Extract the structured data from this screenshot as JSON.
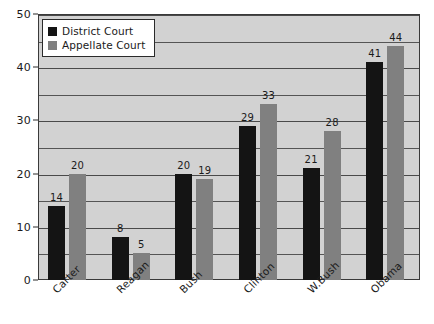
{
  "chart_data": {
    "type": "bar",
    "title": "",
    "xlabel": "",
    "ylabel": "",
    "ylim": [
      0,
      50
    ],
    "y_ticks": [
      0,
      10,
      20,
      30,
      40,
      50
    ],
    "y_tick_labels": [
      "0",
      "10",
      "20",
      "30",
      "40",
      "50"
    ],
    "y_gridlines": [
      5,
      10,
      15,
      20,
      25,
      30,
      35,
      40,
      45,
      50
    ],
    "grid": true,
    "legend_position": "upper left",
    "categories": [
      "Carter",
      "Reagan",
      "Bush",
      "Clinton",
      "W.Bush",
      "Obama"
    ],
    "series": [
      {
        "name": "District Court",
        "color": "#141414",
        "values": [
          14,
          8,
          20,
          29,
          21,
          41
        ],
        "labels": [
          "14",
          "8",
          "20",
          "29",
          "21",
          "41"
        ]
      },
      {
        "name": "Appellate Court",
        "color": "#808080",
        "values": [
          20,
          5,
          19,
          33,
          28,
          44
        ],
        "labels": [
          "20",
          "5",
          "19",
          "33",
          "28",
          "44"
        ]
      }
    ]
  },
  "legend": {
    "items": [
      {
        "label": "District Court",
        "swatch": "#141414",
        "swatch_icon": "legend-square-black-icon"
      },
      {
        "label": "Appellate Court",
        "swatch": "#808080",
        "swatch_icon": "legend-square-gray-icon"
      }
    ]
  },
  "colors": {
    "plot_background": "#d2d2d2",
    "page_background": "#ffffff",
    "gridline": "#555555",
    "axis": "#2a2a2a",
    "district_court": "#141414",
    "appellate_court": "#808080",
    "text": "#1a1a1a"
  }
}
